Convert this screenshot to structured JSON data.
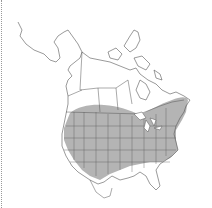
{
  "map": {
    "title": "Range map of North America",
    "region": "North America",
    "range_description": "Shaded range covering most of the contiguous United States and southern Ontario/Quebec",
    "colors": {
      "background": "#ffffff",
      "range_fill": "#b4b4b4",
      "borders": "#555555",
      "edge_dots": "#999999"
    }
  }
}
